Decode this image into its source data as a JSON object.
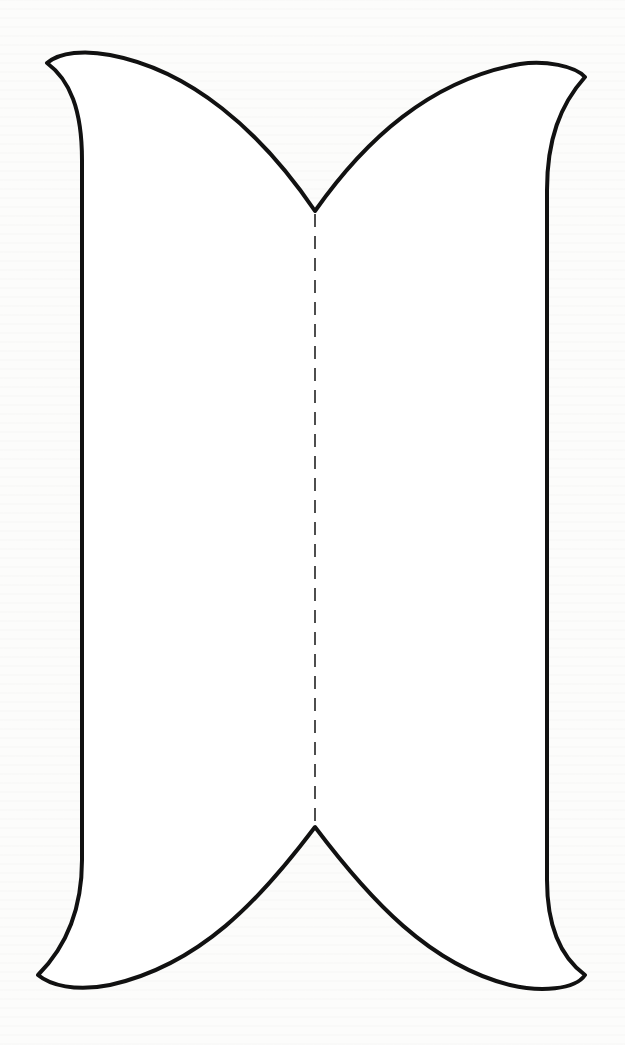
{
  "diagram": {
    "type": "cut-out fold template",
    "shape": "symmetric outline with pointed notches at top and bottom center and flared corner tips",
    "outline": {
      "stroke_color": "#111111",
      "stroke_width": 4,
      "fill": "#ffffff"
    },
    "fold_line": {
      "style": "dashed",
      "stroke_color": "#222222",
      "x": 315,
      "y_start": 211,
      "y_end": 826
    },
    "background_color": "#fcfcfb"
  }
}
